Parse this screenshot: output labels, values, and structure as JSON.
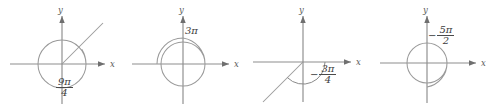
{
  "figure": {
    "background": "#ffffff",
    "line_color": "#9a9a9a",
    "text_color": "#3c3c3c",
    "axis_label_x": "x",
    "axis_label_y": "y"
  },
  "panels": [
    {
      "id": "panel-1",
      "angle_label": {
        "sign": "",
        "numerator": "9π",
        "denominator": "4",
        "is_fraction": true
      },
      "angle_text": "9π/4",
      "direction": "counterclockwise",
      "turns": 1.125,
      "terminal_ray": true,
      "terminal_angle_deg": 45,
      "label_pos": {
        "x": 57,
        "y": 80
      }
    },
    {
      "id": "panel-2",
      "angle_label": {
        "sign": "",
        "numerator": "3π",
        "denominator": "",
        "is_fraction": false
      },
      "angle_text": "3π",
      "direction": "counterclockwise",
      "turns": 1.5,
      "terminal_ray": false,
      "terminal_angle_deg": 180,
      "label_pos": {
        "x": 183,
        "y": 28
      }
    },
    {
      "id": "panel-3",
      "angle_label": {
        "sign": "−",
        "numerator": "3π",
        "denominator": "4",
        "is_fraction": true
      },
      "angle_text": "-3π/4",
      "direction": "clockwise",
      "turns": 0.375,
      "terminal_ray": true,
      "terminal_angle_deg": 225,
      "label_pos": {
        "x": 318,
        "y": 70
      }
    },
    {
      "id": "panel-4",
      "angle_label": {
        "sign": "−",
        "numerator": "5π",
        "denominator": "2",
        "is_fraction": true
      },
      "angle_text": "-5π/2",
      "direction": "clockwise",
      "turns": 1.25,
      "terminal_ray": false,
      "terminal_angle_deg": 270,
      "label_pos": {
        "x": 430,
        "y": 27
      }
    }
  ]
}
